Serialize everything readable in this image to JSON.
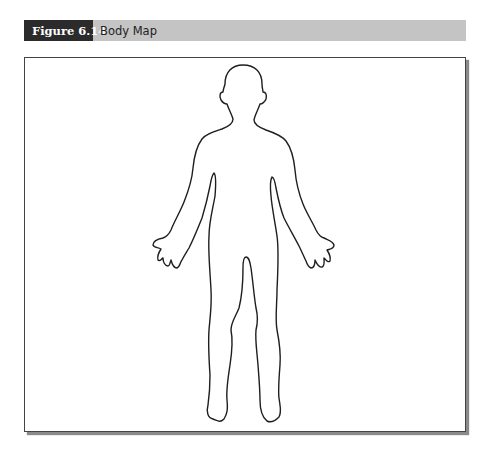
{
  "figure": {
    "label": "Figure 6.14",
    "title": "Body Map"
  },
  "diagram": {
    "type": "body-outline",
    "view": "front",
    "outline_color": "#1e1e1e",
    "frame_border_color": "#444444",
    "header_bar_color": "#c4c4c4",
    "label_box_color": "#2b2b2b"
  }
}
